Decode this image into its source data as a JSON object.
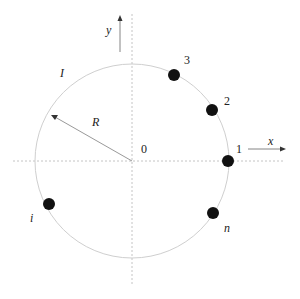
{
  "diagram": {
    "type": "circle-points",
    "center_label": "0",
    "radius_label": "R",
    "arc_label": "I",
    "axes": {
      "x_label": "x",
      "y_label": "y"
    },
    "points": [
      {
        "label": "1",
        "angle_deg": 0
      },
      {
        "label": "2",
        "angle_deg": 30
      },
      {
        "label": "3",
        "angle_deg": 58
      },
      {
        "label": "n",
        "angle_deg": -33
      },
      {
        "label": "i",
        "angle_deg": 205
      }
    ],
    "colors": {
      "circle": "#cccccc",
      "axis": "#bbbbbb",
      "point": "#111111",
      "arrow": "#555555"
    }
  }
}
